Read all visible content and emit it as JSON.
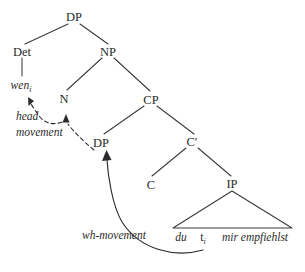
{
  "figure": {
    "type": "syntax-tree",
    "background_color": "#ffffff",
    "ink_color": "#2b2b2b"
  },
  "nodes": {
    "root_dp": "DP",
    "det": "Det",
    "np": "NP",
    "n": "N",
    "cp": "CP",
    "spec_dp": "DP",
    "cbar": "C′",
    "c": "C",
    "ip": "IP"
  },
  "terminals": {
    "wen": "wen",
    "wen_index": "i",
    "du": "du",
    "trace": "t",
    "trace_index": "i",
    "vp_string": "mir empfiehlst"
  },
  "annotations": {
    "head_movement_line1": "head",
    "head_movement_line2": "movement",
    "wh_movement": "wh-movement"
  },
  "arrows": [
    {
      "name": "head-movement-arrow",
      "style": "dashed",
      "from": "spec_dp",
      "to_primary": "n",
      "to_secondary": "wen",
      "label": "head movement",
      "arrowhead_count": 2
    },
    {
      "name": "wh-movement-arrow",
      "style": "solid",
      "from": "trace",
      "to_primary": "spec_dp",
      "label": "wh-movement",
      "arrowhead_count": 1
    }
  ]
}
